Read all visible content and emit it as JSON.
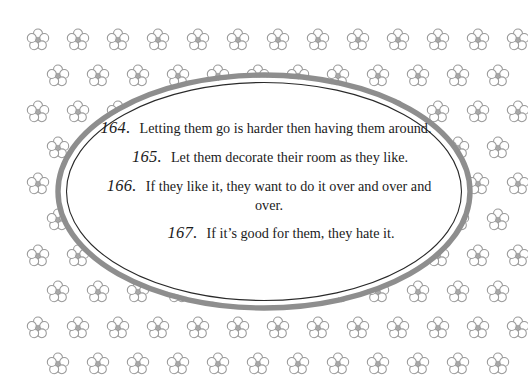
{
  "page": {
    "background_color": "#ffffff",
    "width": 528,
    "height": 388
  },
  "decor": {
    "flower_icon_name": "five-petal-flower-icon",
    "flower_color": "#9a9a9a",
    "flower_rows": 10,
    "flower_columns": 12,
    "flower_spacing_x": 40,
    "flower_spacing_y": 36,
    "oval_outer_color": "#8e8e8e",
    "oval_inner_line_color": "#2a2a2a",
    "oval_fill_color": "#ffffff"
  },
  "quotes": [
    {
      "number": "164.",
      "text": "Letting them go is harder then having them around."
    },
    {
      "number": "165.",
      "text": "Let them decorate their room as they like."
    },
    {
      "number": "166.",
      "text": "If they like it, they want to do it over and over and over."
    },
    {
      "number": "167.",
      "text": "If it’s good for them, they hate it."
    }
  ]
}
